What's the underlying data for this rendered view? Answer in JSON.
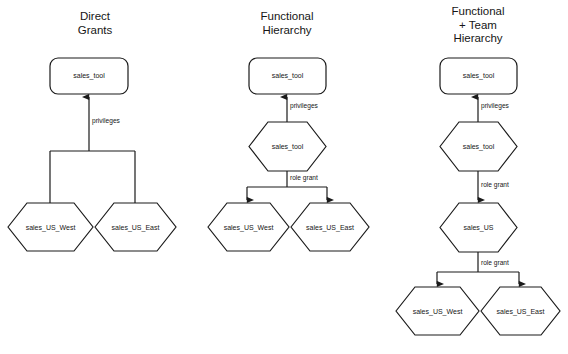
{
  "figure": {
    "background": "#ffffff",
    "stroke_color": "#1a1a1a",
    "text_color": "#161616"
  },
  "columns": [
    {
      "id": "direct-grants",
      "title": "Direct\nGrants",
      "title_box": {
        "x": 46,
        "y": 10,
        "w": 98
      },
      "nodes": [
        {
          "id": "c1-sales-tool",
          "shape": "rounded-rect",
          "label": "sales_tool",
          "x": 50,
          "y": 58,
          "w": 78,
          "h": 36
        },
        {
          "id": "c1-sales-us-west",
          "shape": "hexagon",
          "label": "sales_US_West",
          "x": 8,
          "y": 203,
          "w": 85,
          "h": 48
        },
        {
          "id": "c1-sales-us-east",
          "shape": "hexagon",
          "label": "sales_US_East",
          "x": 95,
          "y": 203,
          "w": 81,
          "h": 48
        }
      ],
      "edges": [
        {
          "id": "c1-privileges",
          "label": "privileges",
          "label_x": 92,
          "label_y": 117
        }
      ]
    },
    {
      "id": "functional-hierarchy",
      "title": "Functional\nHierarchy",
      "title_box": {
        "x": 238,
        "y": 10,
        "w": 98
      },
      "nodes": [
        {
          "id": "c2-sales-tool-rect",
          "shape": "rounded-rect",
          "label": "sales_tool",
          "x": 249,
          "y": 58,
          "w": 77,
          "h": 36
        },
        {
          "id": "c2-sales-tool-hex",
          "shape": "hexagon",
          "label": "sales_tool",
          "x": 249,
          "y": 122,
          "w": 77,
          "h": 49
        },
        {
          "id": "c2-sales-us-west",
          "shape": "hexagon",
          "label": "sales_US_West",
          "x": 208,
          "y": 203,
          "w": 81,
          "h": 48
        },
        {
          "id": "c2-sales-us-east",
          "shape": "hexagon",
          "label": "sales_US_East",
          "x": 291,
          "y": 203,
          "w": 78,
          "h": 48
        }
      ],
      "edges": [
        {
          "id": "c2-privileges",
          "label": "privileges",
          "label_x": 290,
          "label_y": 102
        },
        {
          "id": "c2-role-grant",
          "label": "role grant",
          "label_x": 290,
          "label_y": 174
        }
      ]
    },
    {
      "id": "functional-team-hierarchy",
      "title": "Functional\n+ Team\nHierarchy",
      "title_box": {
        "x": 429,
        "y": 5,
        "w": 98
      },
      "nodes": [
        {
          "id": "c3-sales-tool-rect",
          "shape": "rounded-rect",
          "label": "sales_tool",
          "x": 440,
          "y": 58,
          "w": 77,
          "h": 36
        },
        {
          "id": "c3-sales-tool-hex",
          "shape": "hexagon",
          "label": "sales_tool",
          "x": 440,
          "y": 122,
          "w": 77,
          "h": 49
        },
        {
          "id": "c3-sales-us",
          "shape": "hexagon",
          "label": "sales_US",
          "x": 440,
          "y": 203,
          "w": 77,
          "h": 49
        },
        {
          "id": "c3-sales-us-west",
          "shape": "hexagon",
          "label": "sales_US_West",
          "x": 396,
          "y": 287,
          "w": 83,
          "h": 48
        },
        {
          "id": "c3-sales-us-east",
          "shape": "hexagon",
          "label": "sales_US_East",
          "x": 481,
          "y": 287,
          "w": 79,
          "h": 48
        }
      ],
      "edges": [
        {
          "id": "c3-privileges",
          "label": "privileges",
          "label_x": 481,
          "label_y": 102
        },
        {
          "id": "c3-role-grant-1",
          "label": "role grant",
          "label_x": 481,
          "label_y": 181
        },
        {
          "id": "c3-role-grant-2",
          "label": "role grant",
          "label_x": 481,
          "label_y": 259
        }
      ]
    }
  ]
}
